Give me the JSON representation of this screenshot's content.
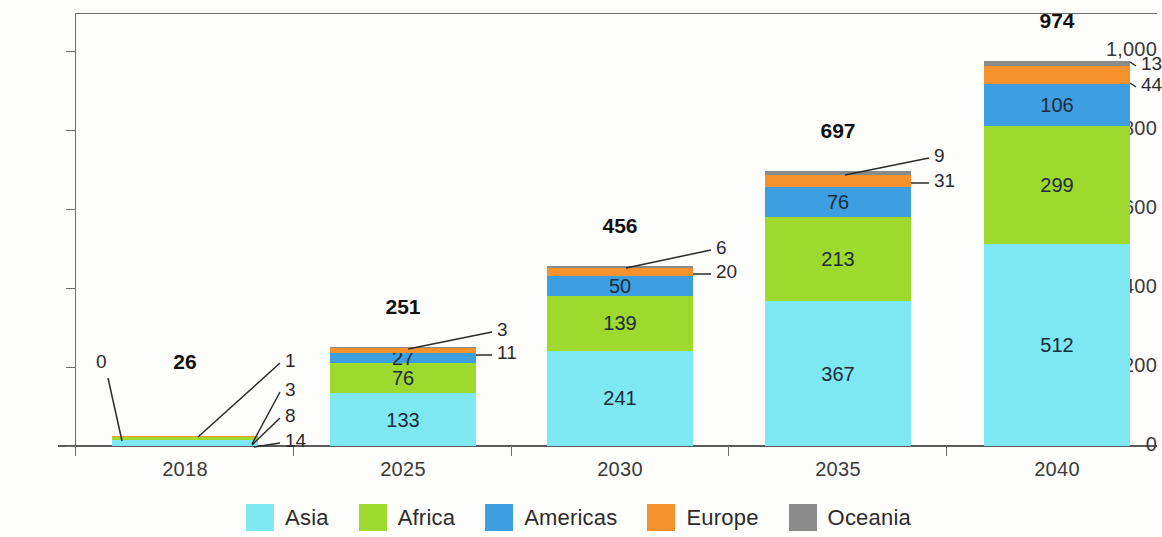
{
  "chart_data": {
    "type": "bar",
    "subtype": "stacked-column",
    "title": "",
    "xlabel": "",
    "ylabel": "",
    "categories": [
      "2018",
      "2025",
      "2030",
      "2035",
      "2040"
    ],
    "series": [
      {
        "name": "Asia",
        "color": "#7de8f2",
        "values": [
          14,
          133,
          241,
          367,
          512
        ]
      },
      {
        "name": "Africa",
        "color": "#9ed92e",
        "values": [
          8,
          76,
          139,
          213,
          299
        ]
      },
      {
        "name": "Americas",
        "color": "#3d9fe0",
        "values": [
          3,
          27,
          50,
          76,
          106
        ]
      },
      {
        "name": "Europe",
        "color": "#f5922e",
        "values": [
          1,
          11,
          20,
          31,
          44
        ]
      },
      {
        "name": "Oceania",
        "color": "#8a8a8a",
        "values": [
          0,
          3,
          6,
          9,
          13
        ]
      }
    ],
    "totals": [
      26,
      251,
      456,
      697,
      974
    ],
    "ylim": [
      0,
      1000
    ],
    "yticks": [
      0,
      200,
      400,
      600,
      800,
      1000
    ],
    "ytick_labels": [
      "0",
      "200",
      "400",
      "600",
      "800",
      "1,000"
    ],
    "grid": false,
    "legend_position": "bottom",
    "inside_labels": {
      "2018": [],
      "2025": [
        "133",
        "76",
        "27"
      ],
      "2030": [
        "241",
        "139",
        "50"
      ],
      "2035": [
        "367",
        "213",
        "76"
      ],
      "2040": [
        "512",
        "299",
        "106"
      ]
    },
    "callout_labels": {
      "2018": [
        "0",
        "1",
        "3",
        "8",
        "14"
      ],
      "2025": [
        "3",
        "11"
      ],
      "2030": [
        "6",
        "20"
      ],
      "2035": [
        "9",
        "31"
      ],
      "2040": [
        "13",
        "44"
      ]
    }
  },
  "axis": {
    "y_ticks": [
      {
        "label": "1,000",
        "value": 1000
      },
      {
        "label": "800",
        "value": 800
      },
      {
        "label": "600",
        "value": 600
      },
      {
        "label": "400",
        "value": 400
      },
      {
        "label": "200",
        "value": 200
      },
      {
        "label": "0",
        "value": 0
      }
    ],
    "x_ticks": [
      {
        "label": "2018"
      },
      {
        "label": "2025"
      },
      {
        "label": "2030"
      },
      {
        "label": "2035"
      },
      {
        "label": "2040"
      }
    ]
  },
  "bars": [
    {
      "year": "2018",
      "total": "26",
      "segments": [
        {
          "region": "Asia",
          "value": "14",
          "inside": false
        },
        {
          "region": "Africa",
          "value": "8",
          "inside": false
        },
        {
          "region": "Americas",
          "value": "3",
          "inside": false
        },
        {
          "region": "Europe",
          "value": "1",
          "inside": false
        },
        {
          "region": "Oceania",
          "value": "0",
          "inside": false
        }
      ]
    },
    {
      "year": "2025",
      "total": "251",
      "segments": [
        {
          "region": "Asia",
          "value": "133",
          "inside": true
        },
        {
          "region": "Africa",
          "value": "76",
          "inside": true
        },
        {
          "region": "Americas",
          "value": "27",
          "inside": true
        },
        {
          "region": "Europe",
          "value": "11",
          "inside": false
        },
        {
          "region": "Oceania",
          "value": "3",
          "inside": false
        }
      ]
    },
    {
      "year": "2030",
      "total": "456",
      "segments": [
        {
          "region": "Asia",
          "value": "241",
          "inside": true
        },
        {
          "region": "Africa",
          "value": "139",
          "inside": true
        },
        {
          "region": "Americas",
          "value": "50",
          "inside": true
        },
        {
          "region": "Europe",
          "value": "20",
          "inside": false
        },
        {
          "region": "Oceania",
          "value": "6",
          "inside": false
        }
      ]
    },
    {
      "year": "2035",
      "total": "697",
      "segments": [
        {
          "region": "Asia",
          "value": "367",
          "inside": true
        },
        {
          "region": "Africa",
          "value": "213",
          "inside": true
        },
        {
          "region": "Americas",
          "value": "76",
          "inside": true
        },
        {
          "region": "Europe",
          "value": "31",
          "inside": false
        },
        {
          "region": "Oceania",
          "value": "9",
          "inside": false
        }
      ]
    },
    {
      "year": "2040",
      "total": "974",
      "segments": [
        {
          "region": "Asia",
          "value": "512",
          "inside": true
        },
        {
          "region": "Africa",
          "value": "299",
          "inside": true
        },
        {
          "region": "Americas",
          "value": "106",
          "inside": true
        },
        {
          "region": "Europe",
          "value": "44",
          "inside": false
        },
        {
          "region": "Oceania",
          "value": "13",
          "inside": false
        }
      ]
    }
  ],
  "legend": {
    "items": [
      {
        "label": "Asia",
        "color": "#7de8f2"
      },
      {
        "label": "Africa",
        "color": "#9ed92e"
      },
      {
        "label": "Americas",
        "color": "#3d9fe0"
      },
      {
        "label": "Europe",
        "color": "#f5922e"
      },
      {
        "label": "Oceania",
        "color": "#8a8a8a"
      }
    ]
  }
}
